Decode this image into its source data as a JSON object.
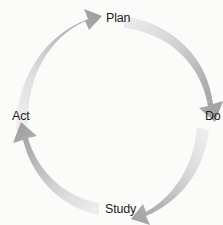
{
  "diagram": {
    "name": "PDSA cycle",
    "type": "cyclic-process",
    "direction": "clockwise",
    "background_color": "#fbfbfa",
    "arrow_color_dark": "#a0a0a0",
    "arrow_color_light": "#f0f0f0",
    "label_color": "#1d1d1d",
    "center": {
      "x": 111,
      "y": 116
    },
    "inner_radius": 62,
    "outer_radius": 95,
    "labels": [
      {
        "id": "plan",
        "text": "Plan"
      },
      {
        "id": "do",
        "text": "Do"
      },
      {
        "id": "study",
        "text": "Study"
      },
      {
        "id": "act",
        "text": "Act"
      }
    ],
    "arrows": [
      {
        "id": "arrow-to-plan",
        "from": "Act",
        "to": "Plan",
        "quadrant": "top-left"
      },
      {
        "id": "arrow-to-do",
        "from": "Plan",
        "to": "Do",
        "quadrant": "top-right"
      },
      {
        "id": "arrow-to-study",
        "from": "Do",
        "to": "Study",
        "quadrant": "bottom-right"
      },
      {
        "id": "arrow-to-act",
        "from": "Study",
        "to": "Act",
        "quadrant": "bottom-left"
      }
    ]
  }
}
